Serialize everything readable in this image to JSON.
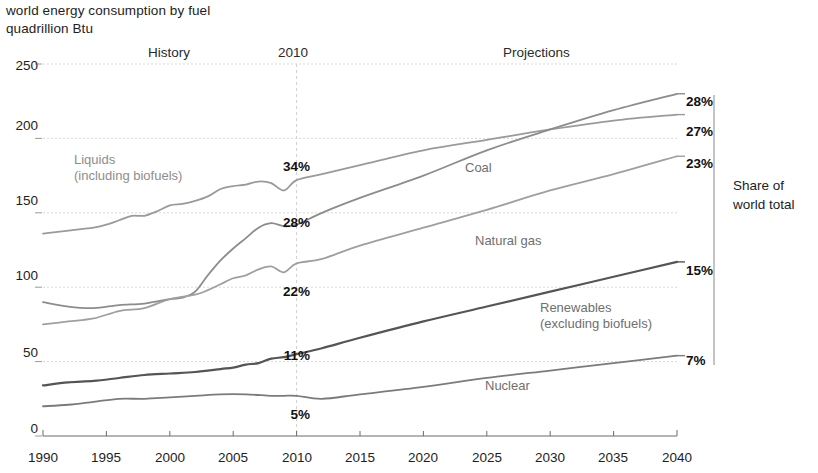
{
  "chart_data": {
    "type": "line",
    "title": "world energy consumption by fuel",
    "subtitle": "quadrillion Btu",
    "ylabel": "quadrillion Btu",
    "xlabel": "",
    "ylim": [
      0,
      250
    ],
    "xlim": [
      1990,
      2040
    ],
    "yticks": [
      "0",
      "50",
      "100",
      "150",
      "200",
      "250"
    ],
    "xticks": [
      "1990",
      "1995",
      "2000",
      "2005",
      "2010",
      "2015",
      "2020",
      "2025",
      "2030",
      "2035",
      "2040"
    ],
    "grid": "horizontal dotted gridlines; vertical dashed divider at 2010",
    "legend_position": "inline labels on plot",
    "annotations": {
      "history": "History",
      "divider_year": "2010",
      "projections": "Projections",
      "share_note_line1": "Share of",
      "share_note_line2": "world total"
    },
    "x": [
      1990,
      1995,
      2000,
      2005,
      2010,
      2015,
      2020,
      2025,
      2030,
      2035,
      2040
    ],
    "series": [
      {
        "name": "Liquids (including biofuels)",
        "label_line1": "Liquids",
        "label_line2": "(including biofuels)",
        "color": "#9a9a9a",
        "share_2010": "34%",
        "share_2040": "27%",
        "values": [
          136,
          142,
          155,
          168,
          172,
          182,
          192,
          199,
          206,
          212,
          216
        ],
        "detail_x": [
          1990,
          1991,
          1992,
          1993,
          1994,
          1995,
          1996,
          1997,
          1998,
          1999,
          2000,
          2001,
          2002,
          2003,
          2004,
          2005,
          2006,
          2007,
          2008,
          2009,
          2010,
          2012,
          2015,
          2020,
          2025,
          2030,
          2035,
          2040
        ],
        "detail_y": [
          136,
          137,
          138,
          139,
          140,
          142,
          145,
          148,
          148,
          151,
          155,
          156,
          158,
          161,
          166,
          168,
          169,
          171,
          170,
          165,
          172,
          176,
          182,
          192,
          199,
          206,
          212,
          216
        ]
      },
      {
        "name": "Coal",
        "label_line1": "Coal",
        "label_line2": "",
        "color": "#8c8c8c",
        "share_2010": "28%",
        "share_2040": "28%",
        "values": [
          90,
          92,
          95,
          120,
          142,
          160,
          175,
          192,
          206,
          219,
          230
        ],
        "detail_x": [
          1990,
          1992,
          1994,
          1996,
          1998,
          2000,
          2001,
          2002,
          2003,
          2004,
          2005,
          2006,
          2007,
          2008,
          2009,
          2010,
          2012,
          2015,
          2020,
          2025,
          2030,
          2035,
          2040
        ],
        "detail_y": [
          90,
          87,
          86,
          88,
          89,
          92,
          93,
          97,
          108,
          118,
          126,
          133,
          140,
          143,
          141,
          142,
          150,
          160,
          175,
          192,
          206,
          219,
          230
        ]
      },
      {
        "name": "Natural gas",
        "label_line1": "Natural gas",
        "label_line2": "",
        "color": "#9f9f9f",
        "share_2010": "22%",
        "share_2040": "23%",
        "values": [
          75,
          82,
          92,
          106,
          116,
          128,
          140,
          152,
          165,
          176,
          188
        ],
        "detail_x": [
          1990,
          1992,
          1994,
          1996,
          1998,
          2000,
          2002,
          2003,
          2004,
          2005,
          2006,
          2007,
          2008,
          2009,
          2010,
          2012,
          2015,
          2020,
          2025,
          2030,
          2035,
          2040
        ],
        "detail_y": [
          75,
          77,
          79,
          84,
          86,
          92,
          95,
          98,
          102,
          106,
          108,
          112,
          114,
          110,
          116,
          119,
          128,
          140,
          152,
          165,
          176,
          188
        ]
      },
      {
        "name": "Renewables (excluding biofuels)",
        "label_line1": "Renewables",
        "label_line2": "(excluding biofuels)",
        "color": "#555555",
        "share_2010": "11%",
        "share_2040": "15%",
        "values": [
          34,
          38,
          42,
          46,
          55,
          66,
          77,
          87,
          97,
          107,
          117
        ],
        "detail_x": [
          1990,
          1992,
          1994,
          1996,
          1998,
          2000,
          2002,
          2004,
          2005,
          2006,
          2007,
          2008,
          2009,
          2010,
          2012,
          2015,
          2020,
          2025,
          2030,
          2035,
          2040
        ],
        "detail_y": [
          34,
          36,
          37,
          39,
          41,
          42,
          43,
          45,
          46,
          48,
          49,
          52,
          53,
          55,
          59,
          66,
          77,
          87,
          97,
          107,
          117
        ]
      },
      {
        "name": "Nuclear",
        "label_line1": "Nuclear",
        "label_line2": "",
        "color": "#7b7b7b",
        "share_2010": "5%",
        "share_2040": "7%",
        "values": [
          20,
          23,
          25,
          26,
          27,
          28,
          33,
          39,
          44,
          49,
          54
        ],
        "detail_x": [
          1990,
          1992,
          1994,
          1996,
          1998,
          2000,
          2002,
          2004,
          2006,
          2008,
          2009,
          2010,
          2012,
          2015,
          2020,
          2025,
          2030,
          2035,
          2040
        ],
        "detail_y": [
          20,
          21,
          23,
          25,
          25,
          26,
          27,
          28,
          28,
          27,
          27,
          27,
          25,
          28,
          33,
          39,
          44,
          49,
          54
        ]
      }
    ]
  }
}
